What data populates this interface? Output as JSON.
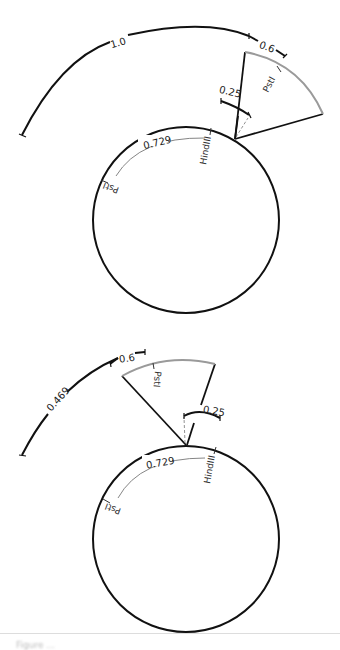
{
  "colors": {
    "stroke": "#111111",
    "wedge_arc": "#9a9a9a",
    "thin": "#555555",
    "dashed": "#777777"
  },
  "diagrams": [
    {
      "id": "top",
      "circle": {
        "cx": 186,
        "cy": 220,
        "r": 93
      },
      "labels": {
        "outer_arc_long": "1.0",
        "outer_arc_short": "0.6",
        "wedge_site": "PstI",
        "bracket": "0.25",
        "inner_arc": "0.729",
        "site_left": "PstI",
        "site_right": "HindIII"
      }
    },
    {
      "id": "bottom",
      "circle": {
        "cx": 186,
        "cy": 539,
        "r": 93
      },
      "labels": {
        "outer_arc_long": "0.469",
        "outer_arc_short": "0.6",
        "wedge_site": "PstI",
        "bracket": "0.25",
        "inner_arc": "0.729",
        "site_left": "PstI",
        "site_right": "HindIII"
      }
    }
  ],
  "caption": {
    "text": "Figure ..."
  }
}
